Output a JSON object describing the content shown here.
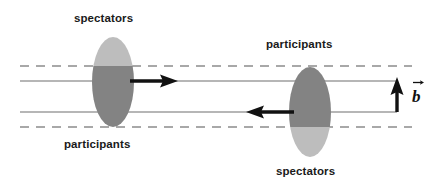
{
  "figure": {
    "labels": {
      "spectators_top_left": "spectators",
      "participants_bottom_left": "participants",
      "participants_top_right": "participants",
      "spectators_bottom_right": "spectators",
      "impact_parameter": "b"
    },
    "colors": {
      "nucleus_light": "#bdbdbd",
      "nucleus_dark": "#838383",
      "beam_line": "#6e6e6e",
      "dashed_line": "#8c8c8c",
      "arrow": "#111111",
      "text": "#1a1a1a",
      "background": "#ffffff"
    },
    "geometry": {
      "canvas_width": 435,
      "canvas_height": 192,
      "dashed_line_top_y": 66,
      "dashed_line_bottom_y": 127,
      "beam_line_upper_y": 81,
      "beam_line_lower_y": 112,
      "line_x_start": 20,
      "line_x_end": 397,
      "dashed_x_start": 20,
      "dashed_x_end": 412,
      "left_nucleus": {
        "cx": 113,
        "cy": 82,
        "rx": 21,
        "ry": 45,
        "split_y": 66,
        "top_fill": "light",
        "bottom_fill": "dark"
      },
      "right_nucleus": {
        "cx": 310,
        "cy": 112,
        "rx": 21,
        "ry": 45,
        "split_y": 127,
        "top_fill": "dark",
        "bottom_fill": "light"
      },
      "arrow_right": {
        "x_start": 134,
        "x_end": 178,
        "y": 81
      },
      "arrow_left": {
        "x_start": 290,
        "x_end": 246,
        "y": 112
      },
      "arrow_b": {
        "x": 397,
        "y_start": 112,
        "y_end": 79
      }
    }
  }
}
